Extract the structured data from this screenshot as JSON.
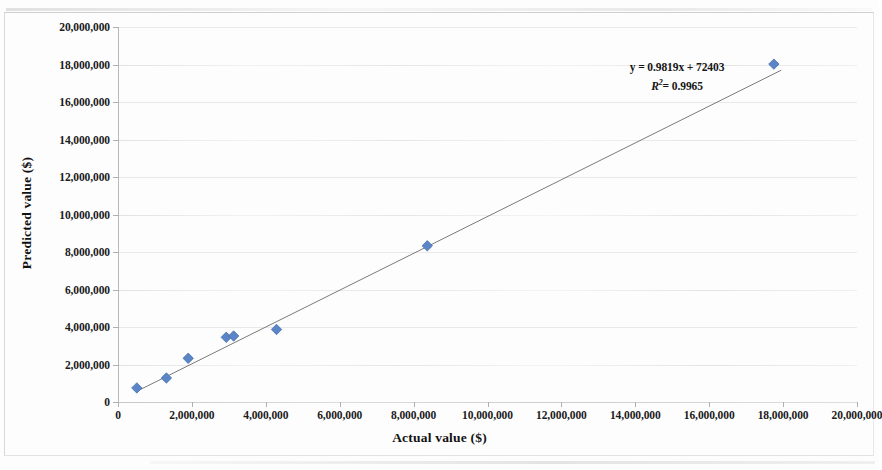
{
  "chart_data": {
    "type": "scatter",
    "title": "",
    "xlabel": "Actual value ($)",
    "ylabel": "Predicted value ($)",
    "xlim": [
      0,
      20000000
    ],
    "ylim": [
      0,
      20000000
    ],
    "xticks": [
      0,
      2000000,
      4000000,
      6000000,
      8000000,
      10000000,
      12000000,
      14000000,
      16000000,
      18000000,
      20000000
    ],
    "yticks": [
      0,
      2000000,
      4000000,
      6000000,
      8000000,
      10000000,
      12000000,
      14000000,
      16000000,
      18000000,
      20000000
    ],
    "xtick_labels": [
      "0",
      "2,000,000",
      "4,000,000",
      "6,000,000",
      "8,000,000",
      "10,000,000",
      "12,000,000",
      "14,000,000",
      "16,000,000",
      "18,000,000",
      "20,000,000"
    ],
    "ytick_labels": [
      "0",
      "2,000,000",
      "4,000,000",
      "6,000,000",
      "8,000,000",
      "10,000,000",
      "12,000,000",
      "14,000,000",
      "16,000,000",
      "18,000,000",
      "20,000,000"
    ],
    "grid": true,
    "grid_axis": "y",
    "legend": false,
    "marker": "diamond",
    "marker_color": "#5B85C8",
    "marker_edge_color": "#4472A8",
    "trendline_color": "#6b6b6b",
    "series": [
      {
        "name": "Predicted vs actual",
        "points": [
          {
            "x": 510000,
            "y": 750000
          },
          {
            "x": 1310000,
            "y": 1280000
          },
          {
            "x": 1900000,
            "y": 2330000
          },
          {
            "x": 2930000,
            "y": 3450000
          },
          {
            "x": 3130000,
            "y": 3520000
          },
          {
            "x": 4290000,
            "y": 3870000
          },
          {
            "x": 8370000,
            "y": 8330000
          },
          {
            "x": 17750000,
            "y": 18020000
          }
        ]
      }
    ],
    "trendline": {
      "slope": 0.9819,
      "intercept": 72403,
      "x_start": 510000,
      "x_end": 17950000
    },
    "annotations": {
      "equation": "y = 0.9819x + 72403",
      "r_squared_label": "R",
      "r_squared_exponent": "2",
      "r_squared_value": "= 0.9965"
    }
  },
  "figure": {
    "background_color": "#fdfdfd",
    "axis_color": "#b9b9b9",
    "gridline_color": "#e9e9e9",
    "text_color": "#1b1b1b"
  }
}
